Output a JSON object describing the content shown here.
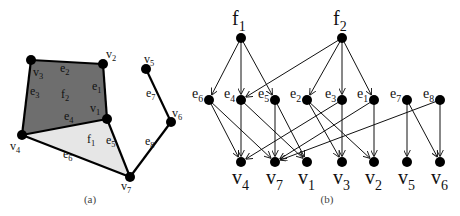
{
  "figure_a": {
    "caption": "(a)",
    "faces": [
      {
        "id": "f2",
        "label": "f",
        "sub": "2",
        "fill": "#6e6e6e",
        "vertices": [
          "v3",
          "v2",
          "v1",
          "v4"
        ]
      },
      {
        "id": "f1",
        "label": "f",
        "sub": "1",
        "fill": "#e6e6e6",
        "vertices": [
          "v4",
          "v1",
          "v7"
        ]
      }
    ],
    "vertices": [
      {
        "id": "v1",
        "label": "v",
        "sub": "1",
        "x": 107,
        "y": 119
      },
      {
        "id": "v2",
        "label": "v",
        "sub": "2",
        "x": 103,
        "y": 64
      },
      {
        "id": "v3",
        "label": "v",
        "sub": "3",
        "x": 31,
        "y": 60
      },
      {
        "id": "v4",
        "label": "v",
        "sub": "4",
        "x": 22,
        "y": 135
      },
      {
        "id": "v5",
        "label": "v",
        "sub": "5",
        "x": 146,
        "y": 69
      },
      {
        "id": "v6",
        "label": "v",
        "sub": "6",
        "x": 171,
        "y": 122
      },
      {
        "id": "v7",
        "label": "v",
        "sub": "7",
        "x": 130,
        "y": 177
      }
    ],
    "edges": [
      {
        "id": "e1",
        "label": "e",
        "sub": "1",
        "from": "v2",
        "to": "v1"
      },
      {
        "id": "e2",
        "label": "e",
        "sub": "2",
        "from": "v3",
        "to": "v2"
      },
      {
        "id": "e3",
        "label": "e",
        "sub": "3",
        "from": "v3",
        "to": "v4"
      },
      {
        "id": "e4",
        "label": "e",
        "sub": "4",
        "from": "v4",
        "to": "v1"
      },
      {
        "id": "e5",
        "label": "e",
        "sub": "5",
        "from": "v1",
        "to": "v7"
      },
      {
        "id": "e6",
        "label": "e",
        "sub": "6",
        "from": "v4",
        "to": "v7"
      },
      {
        "id": "e7",
        "label": "e",
        "sub": "7",
        "from": "v5",
        "to": "v6"
      },
      {
        "id": "e8",
        "label": "e",
        "sub": "8",
        "from": "v6",
        "to": "v7"
      }
    ]
  },
  "figure_b": {
    "caption": "(b)",
    "faces": [
      {
        "id": "f1",
        "label": "f",
        "sub": "1",
        "x": 241,
        "y": 38
      },
      {
        "id": "f2",
        "label": "f",
        "sub": "2",
        "x": 342,
        "y": 38
      }
    ],
    "edges": [
      {
        "id": "e6",
        "label": "e",
        "sub": "6",
        "x": 209,
        "y": 100
      },
      {
        "id": "e4",
        "label": "e",
        "sub": "4",
        "x": 241,
        "y": 100
      },
      {
        "id": "e5",
        "label": "e",
        "sub": "5",
        "x": 275,
        "y": 100
      },
      {
        "id": "e2",
        "label": "e",
        "sub": "2",
        "x": 307,
        "y": 100
      },
      {
        "id": "e3",
        "label": "e",
        "sub": "3",
        "x": 342,
        "y": 100
      },
      {
        "id": "e1",
        "label": "e",
        "sub": "1",
        "x": 374,
        "y": 100
      },
      {
        "id": "e7",
        "label": "e",
        "sub": "7",
        "x": 407,
        "y": 100
      },
      {
        "id": "e8",
        "label": "e",
        "sub": "8",
        "x": 440,
        "y": 100
      }
    ],
    "vertices": [
      {
        "id": "v4",
        "label": "v",
        "sub": "4",
        "x": 241,
        "y": 162
      },
      {
        "id": "v7",
        "label": "v",
        "sub": "7",
        "x": 275,
        "y": 162
      },
      {
        "id": "v1",
        "label": "v",
        "sub": "1",
        "x": 307,
        "y": 162
      },
      {
        "id": "v3",
        "label": "v",
        "sub": "3",
        "x": 342,
        "y": 162
      },
      {
        "id": "v2",
        "label": "v",
        "sub": "2",
        "x": 374,
        "y": 162
      },
      {
        "id": "v5",
        "label": "v",
        "sub": "5",
        "x": 407,
        "y": 162
      },
      {
        "id": "v6",
        "label": "v",
        "sub": "6",
        "x": 440,
        "y": 162
      }
    ],
    "arcs": [
      [
        "f1",
        "e6"
      ],
      [
        "f1",
        "e4"
      ],
      [
        "f1",
        "e5"
      ],
      [
        "f2",
        "e4"
      ],
      [
        "f2",
        "e2"
      ],
      [
        "f2",
        "e3"
      ],
      [
        "f2",
        "e1"
      ],
      [
        "e6",
        "v4"
      ],
      [
        "e6",
        "v7"
      ],
      [
        "e4",
        "v4"
      ],
      [
        "e4",
        "v1"
      ],
      [
        "e5",
        "v7"
      ],
      [
        "e5",
        "v1"
      ],
      [
        "e2",
        "v3"
      ],
      [
        "e2",
        "v2"
      ],
      [
        "e3",
        "v3"
      ],
      [
        "e3",
        "v4"
      ],
      [
        "e1",
        "v2"
      ],
      [
        "e1",
        "v7"
      ],
      [
        "e7",
        "v5"
      ],
      [
        "e7",
        "v6"
      ],
      [
        "e8",
        "v6"
      ],
      [
        "e8",
        "v7"
      ]
    ]
  },
  "colors": {
    "node": "#000000",
    "line": "#111111",
    "face_dark": "#6e6e6e",
    "face_light": "#e6e6e6"
  }
}
